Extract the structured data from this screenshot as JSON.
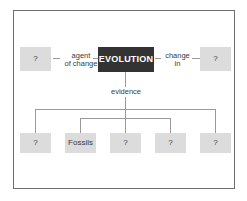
{
  "diagram": {
    "title_node": {
      "label": "EVOLUTION",
      "color": "#333333",
      "text_color": "#ffffff"
    },
    "box_color": "#dcdcdc",
    "line_color": "#9a9a9a",
    "frame_color": "#6e6e6e",
    "left_branch": {
      "link_label": "agent\nof change",
      "node_label": "?"
    },
    "right_branch": {
      "link_label": "change\nin",
      "node_label": "?"
    },
    "evidence_branch": {
      "link_label": "evidence",
      "nodes": [
        {
          "label": "?"
        },
        {
          "label": "Fossils"
        },
        {
          "label": "?"
        },
        {
          "label": "?"
        },
        {
          "label": "?"
        }
      ]
    }
  }
}
